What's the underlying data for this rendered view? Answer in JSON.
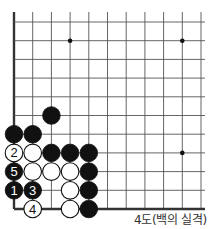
{
  "diagram": {
    "type": "go-board-diagram",
    "caption": "4도(백의 실격)",
    "colors": {
      "line": "#555555",
      "black": "#111111",
      "white": "#ffffff",
      "edge": "#333333"
    },
    "grid": {
      "x": [
        14,
        32.7,
        51.4,
        70.1,
        88.8,
        107.5,
        126.2,
        144.9,
        163.6,
        182.3,
        201
      ],
      "y": [
        22,
        40.7,
        59.4,
        78.1,
        96.8,
        115.5,
        134.2,
        152.9,
        171.6,
        190.3,
        209
      ],
      "left_edge": true,
      "bottom_edge": true
    },
    "star_points": [
      [
        3,
        1
      ],
      [
        9,
        1
      ],
      [
        9,
        7
      ]
    ],
    "stones": [
      {
        "col": 2,
        "row": 5,
        "color": "black",
        "label": ""
      },
      {
        "col": 0,
        "row": 6,
        "color": "black",
        "label": ""
      },
      {
        "col": 1,
        "row": 6,
        "color": "black",
        "label": ""
      },
      {
        "col": 0,
        "row": 7,
        "color": "white",
        "label": "2"
      },
      {
        "col": 1,
        "row": 7,
        "color": "white",
        "label": ""
      },
      {
        "col": 2,
        "row": 7,
        "color": "black",
        "label": ""
      },
      {
        "col": 3,
        "row": 7,
        "color": "black",
        "label": ""
      },
      {
        "col": 4,
        "row": 7,
        "color": "black",
        "label": ""
      },
      {
        "col": 0,
        "row": 8,
        "color": "black",
        "label": "5"
      },
      {
        "col": 1,
        "row": 8,
        "color": "white",
        "label": ""
      },
      {
        "col": 2,
        "row": 8,
        "color": "white",
        "label": ""
      },
      {
        "col": 3,
        "row": 8,
        "color": "white",
        "label": ""
      },
      {
        "col": 4,
        "row": 8,
        "color": "black",
        "label": ""
      },
      {
        "col": 0,
        "row": 9,
        "color": "black",
        "label": "1"
      },
      {
        "col": 1,
        "row": 9,
        "color": "black",
        "label": "3"
      },
      {
        "col": 3,
        "row": 9,
        "color": "white",
        "label": ""
      },
      {
        "col": 4,
        "row": 9,
        "color": "black",
        "label": ""
      },
      {
        "col": 1,
        "row": 10,
        "color": "white",
        "label": "4"
      },
      {
        "col": 3,
        "row": 10,
        "color": "white",
        "label": ""
      },
      {
        "col": 4,
        "row": 10,
        "color": "black",
        "label": ""
      }
    ]
  }
}
